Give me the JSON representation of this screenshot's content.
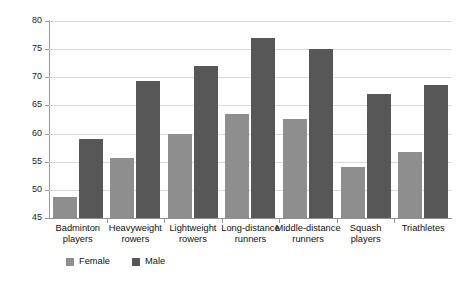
{
  "chart_data": {
    "type": "bar",
    "title": "",
    "xlabel": "",
    "ylabel": "VO2max (ml/kg/min)",
    "ylabel_prefix": "VO",
    "ylabel_sub": "2",
    "ylabel_suffix": "max (ml/kg/min)",
    "ylim": [
      45,
      80
    ],
    "yticks": [
      45,
      50,
      55,
      60,
      65,
      70,
      75,
      80
    ],
    "ytick_labels": [
      "45",
      "50",
      "55",
      "60",
      "65",
      "70",
      "75",
      "80"
    ],
    "grid": true,
    "legend_position": "bottom-left",
    "categories": [
      "Badminton players",
      "Heavyweight rowers",
      "Lightweight rowers",
      "Long-distance runners",
      "Middle-distance runners",
      "Squash players",
      "Triathletes"
    ],
    "category_lines": [
      [
        "Badminton",
        "players"
      ],
      [
        "Heavyweight",
        "rowers"
      ],
      [
        "Lightweight",
        "rowers"
      ],
      [
        "Long-distance",
        "runners"
      ],
      [
        "Middle-distance",
        "runners"
      ],
      [
        "Squash",
        "players"
      ],
      [
        "Triathletes"
      ]
    ],
    "series": [
      {
        "name": "Female",
        "color": "#8e8e8e",
        "values": [
          48.8,
          55.7,
          60.0,
          63.4,
          62.6,
          54.0,
          56.8
        ]
      },
      {
        "name": "Male",
        "color": "#575757",
        "values": [
          59.0,
          69.4,
          72.0,
          77.0,
          75.0,
          67.0,
          68.7
        ]
      }
    ]
  },
  "legend": {
    "items": [
      {
        "label": "Female",
        "color": "#8e8e8e"
      },
      {
        "label": "Male",
        "color": "#575757"
      }
    ]
  }
}
